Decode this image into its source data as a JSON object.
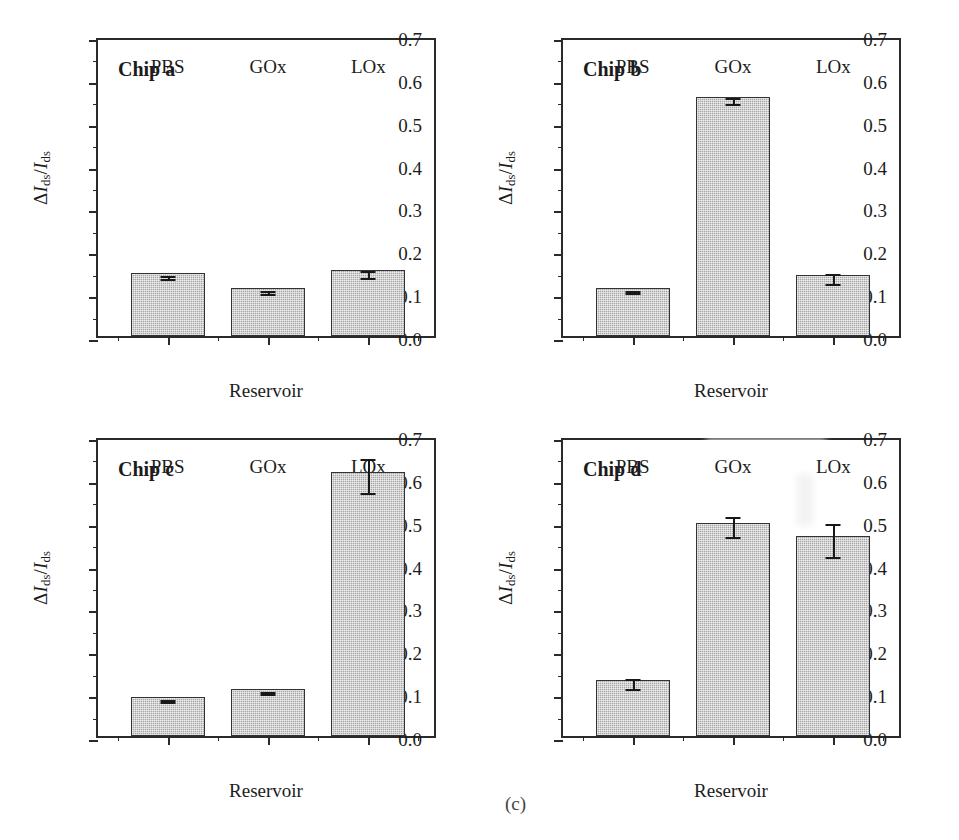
{
  "figure": {
    "caption": "(c)",
    "background": "#ffffff",
    "bar_fill": "#a6a6a6",
    "bar_edge": "#333333",
    "axis_color": "#2a2a2a"
  },
  "axis": {
    "ylabel_delta": "Δ",
    "ylabel_I": "I",
    "ylabel_sub": "ds",
    "ylabel_slash": "/",
    "ylabel_text": "ΔIds/Ids",
    "xlabel": "Reservoir",
    "ytick_labels": [
      "0.0",
      "0.1",
      "0.2",
      "0.3",
      "0.4",
      "0.5",
      "0.6",
      "0.7"
    ],
    "ytick_values": [
      0.0,
      0.1,
      0.2,
      0.3,
      0.4,
      0.5,
      0.6,
      0.7
    ],
    "yminor_values": [
      0.05,
      0.15,
      0.25,
      0.35,
      0.45,
      0.55,
      0.65
    ],
    "ylim": [
      0.0,
      0.7
    ],
    "categories": [
      "PBS",
      "GOx",
      "LOx"
    ]
  },
  "chart_data": [
    {
      "type": "bar",
      "title": "Chip a",
      "panel_id": "a",
      "categories": [
        "PBS",
        "GOx",
        "LOx"
      ],
      "values": [
        0.146,
        0.111,
        0.153
      ],
      "errors": [
        0.004,
        0.003,
        0.008
      ],
      "xlabel": "Reservoir",
      "ylabel": "ΔIds/Ids",
      "ylim": [
        0.0,
        0.7
      ],
      "grid": false,
      "legend": "none"
    },
    {
      "type": "bar",
      "title": "Chip b",
      "panel_id": "b",
      "categories": [
        "PBS",
        "GOx",
        "LOx"
      ],
      "values": [
        0.112,
        0.557,
        0.143
      ],
      "errors": [
        0.003,
        0.007,
        0.012
      ],
      "xlabel": "Reservoir",
      "ylabel": "ΔIds/Ids",
      "ylim": [
        0.0,
        0.7
      ],
      "grid": false,
      "legend": "none"
    },
    {
      "type": "bar",
      "title": "Chip c",
      "panel_id": "c",
      "categories": [
        "PBS",
        "GOx",
        "LOx"
      ],
      "values": [
        0.091,
        0.11,
        0.616
      ],
      "errors": [
        0.003,
        0.003,
        0.039
      ],
      "xlabel": "Reservoir",
      "ylabel": "ΔIds/Ids",
      "ylim": [
        0.0,
        0.7
      ],
      "grid": false,
      "legend": "none"
    },
    {
      "type": "bar",
      "title": "Chip d",
      "panel_id": "d",
      "categories": [
        "PBS",
        "GOx",
        "LOx"
      ],
      "values": [
        0.13,
        0.497,
        0.466
      ],
      "errors": [
        0.012,
        0.023,
        0.039
      ],
      "xlabel": "Reservoir",
      "ylabel": "ΔIds/Ids",
      "ylim": [
        0.0,
        0.7
      ],
      "grid": false,
      "legend": "none"
    }
  ]
}
